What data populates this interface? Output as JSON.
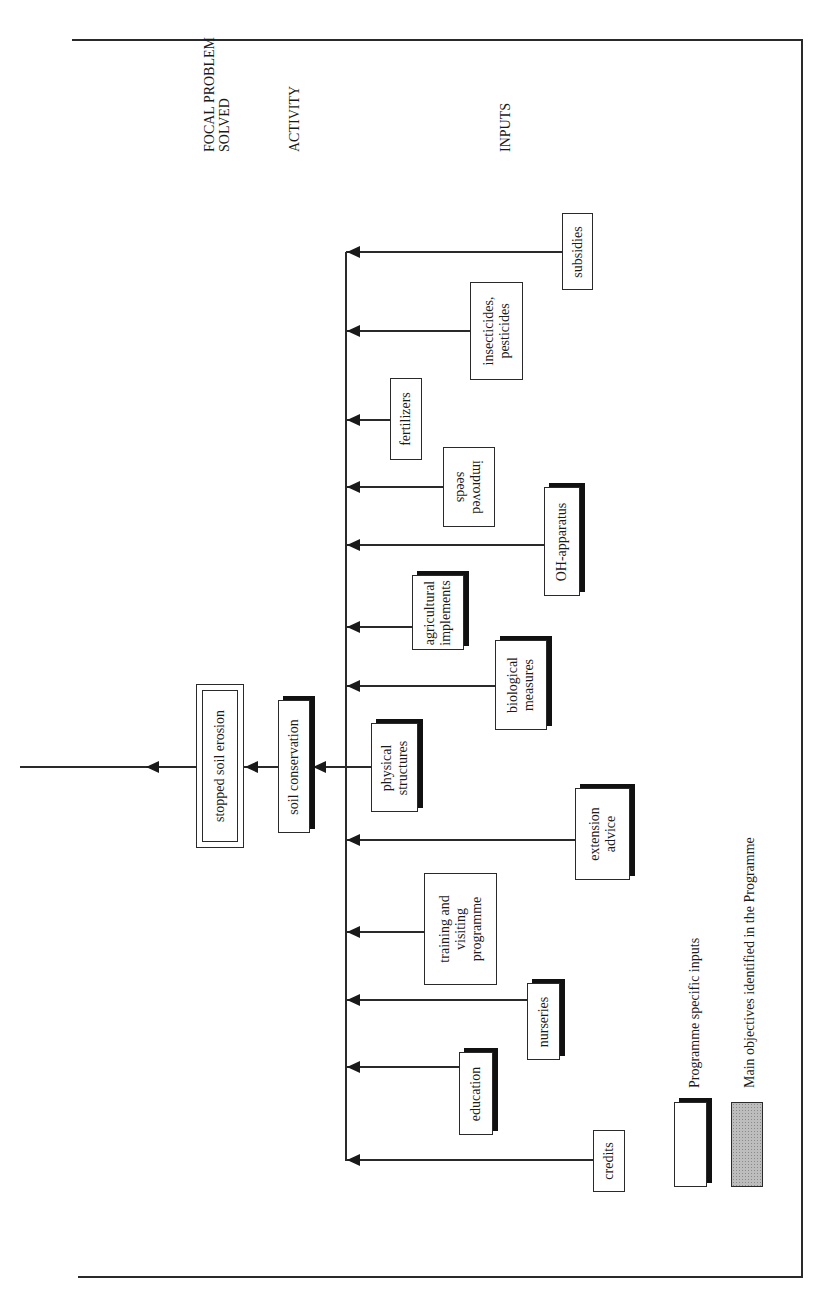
{
  "headings": {
    "focal_line1": "FOCAL PROBLEM",
    "focal_line2": "SOLVED",
    "activity": "ACTIVITY",
    "inputs": "INPUTS"
  },
  "focal_problem": {
    "label": "stopped soil erosion",
    "style": "double-border"
  },
  "activity": {
    "label": "soil conservation",
    "style": "programme-specific"
  },
  "inputs": [
    {
      "label": "subsidies",
      "lines": [
        "subsidies"
      ],
      "programme_specific": false
    },
    {
      "label": "insecticides, pesticides",
      "lines": [
        "insecticides,",
        "pesticides"
      ],
      "programme_specific": false
    },
    {
      "label": "fertilizers",
      "lines": [
        "fertilizers"
      ],
      "programme_specific": false
    },
    {
      "label": "improved seeds",
      "lines": [
        "improved",
        "seeds"
      ],
      "programme_specific": false
    },
    {
      "label": "OH-apparatus",
      "lines": [
        "OH-apparatus"
      ],
      "programme_specific": true
    },
    {
      "label": "agricultural implements",
      "lines": [
        "agricultural",
        "implements"
      ],
      "programme_specific": true
    },
    {
      "label": "biological measures",
      "lines": [
        "biological",
        "measures"
      ],
      "programme_specific": true
    },
    {
      "label": "physical structures",
      "lines": [
        "physical",
        "structures"
      ],
      "programme_specific": true
    },
    {
      "label": "extension advice",
      "lines": [
        "extension",
        "advice"
      ],
      "programme_specific": true
    },
    {
      "label": "training and visiting programme",
      "lines": [
        "training and",
        "visiting",
        "programme"
      ],
      "programme_specific": false
    },
    {
      "label": "nurseries",
      "lines": [
        "nurseries"
      ],
      "programme_specific": true
    },
    {
      "label": "education",
      "lines": [
        "education"
      ],
      "programme_specific": true
    },
    {
      "label": "credits",
      "lines": [
        "credits"
      ],
      "programme_specific": false
    }
  ],
  "legend": {
    "programme_specific": "Programme specific inputs",
    "main_objectives": "Main objectives identified in the Programme"
  },
  "colors": {
    "line": "#2a2a2a",
    "shadow": "#111111",
    "main_objective_fill": "#bdbdbd"
  }
}
